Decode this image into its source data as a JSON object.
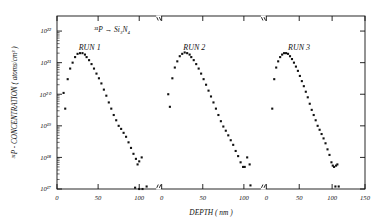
{
  "figure": {
    "annotation_implant": "³¹P → Si₃N₄",
    "xlabel": "DEPTH   ( nm )",
    "ylabel": "³¹P - CONCENTRATION  ( atoms/cm³ )"
  },
  "chart_data": {
    "type": "scatter",
    "title": "³¹P → Si₃N₄",
    "xlabel": "DEPTH (nm)",
    "ylabel": "³¹P - CONCENTRATION (atoms/cm³)",
    "yscale": "log",
    "ylim": [
      1e+17,
      3e+22
    ],
    "ytick_labels": [
      "10²²",
      "10²¹",
      "10²⁰",
      "10¹⁹",
      "10¹⁸",
      "10¹⁷"
    ],
    "ytick_values": [
      1e+22,
      1e+21,
      1e+20,
      1e+19,
      1e+18,
      1e+17
    ],
    "grid": false,
    "legend": "none",
    "axis_breaks": 2,
    "panels": [
      {
        "label": "RUN 1",
        "xlim": [
          0,
          120
        ],
        "xtick_values": [
          0,
          50,
          100
        ],
        "xtick_labels": [
          "0",
          "50",
          "100"
        ],
        "points": [
          [
            8,
            1.1e+20
          ],
          [
            10,
            3.5e+19
          ],
          [
            13,
            3e+20
          ],
          [
            16,
            6.5e+20
          ],
          [
            19,
            1e+21
          ],
          [
            22,
            1.5e+21
          ],
          [
            25,
            1.9e+21
          ],
          [
            28,
            2e+21
          ],
          [
            31,
            2e+21
          ],
          [
            34,
            1.8e+21
          ],
          [
            36,
            1.5e+21
          ],
          [
            39,
            1.2e+21
          ],
          [
            42,
            9e+20
          ],
          [
            45,
            6.5e+20
          ],
          [
            48,
            4.5e+20
          ],
          [
            51,
            3.2e+20
          ],
          [
            54,
            2.2e+20
          ],
          [
            57,
            1.4e+20
          ],
          [
            60,
            9e+19
          ],
          [
            63,
            5.5e+19
          ],
          [
            66,
            3.5e+19
          ],
          [
            69,
            2.2e+19
          ],
          [
            72,
            1.5e+19
          ],
          [
            75,
            1e+19
          ],
          [
            78,
            8e+18
          ],
          [
            81,
            6e+18
          ],
          [
            84,
            4.5e+18
          ],
          [
            87,
            3e+18
          ],
          [
            90,
            2e+18
          ],
          [
            93,
            1.3e+18
          ],
          [
            96,
            9e+17
          ],
          [
            98,
            6e+17
          ],
          [
            100,
            7.5e+17
          ],
          [
            103,
            1e+18
          ],
          [
            95,
            1.1e+17
          ],
          [
            100,
            1e+17
          ],
          [
            104,
            1e+17
          ],
          [
            109,
            1.2e+17
          ]
        ]
      },
      {
        "label": "RUN 2",
        "xlim": [
          0,
          120
        ],
        "xtick_values": [
          0,
          50,
          100
        ],
        "xtick_labels": [
          "0",
          "50",
          "100"
        ],
        "points": [
          [
            8,
            1e+20
          ],
          [
            10,
            4e+19
          ],
          [
            13,
            3.2e+20
          ],
          [
            16,
            7e+20
          ],
          [
            19,
            1.1e+21
          ],
          [
            22,
            1.6e+21
          ],
          [
            25,
            1.9e+21
          ],
          [
            28,
            2.1e+21
          ],
          [
            31,
            2e+21
          ],
          [
            34,
            1.8e+21
          ],
          [
            36,
            1.5e+21
          ],
          [
            39,
            1.2e+21
          ],
          [
            42,
            9e+20
          ],
          [
            45,
            6.5e+20
          ],
          [
            48,
            4.5e+20
          ],
          [
            51,
            3e+20
          ],
          [
            54,
            2e+20
          ],
          [
            57,
            1.3e+20
          ],
          [
            60,
            8.5e+19
          ],
          [
            63,
            5.5e+19
          ],
          [
            66,
            3.5e+19
          ],
          [
            69,
            2.2e+19
          ],
          [
            72,
            1.4e+19
          ],
          [
            75,
            9.5e+18
          ],
          [
            78,
            7e+18
          ],
          [
            81,
            5e+18
          ],
          [
            84,
            3.5e+18
          ],
          [
            87,
            2.5e+18
          ],
          [
            90,
            1.6e+18
          ],
          [
            93,
            1.1e+18
          ],
          [
            96,
            7e+17
          ],
          [
            99,
            5e+17
          ],
          [
            101,
            5e+17
          ],
          [
            104,
            1e+18
          ],
          [
            107,
            6e+17
          ],
          [
            108,
            1.3e+17
          ]
        ]
      },
      {
        "label": "RUN 3",
        "xlim": [
          0,
          150
        ],
        "xtick_values": [
          0,
          50,
          100,
          150
        ],
        "xtick_labels": [
          "0",
          "50",
          "100",
          "150"
        ],
        "points": [
          [
            9,
            3.5e+19
          ],
          [
            12,
            3e+20
          ],
          [
            15,
            7e+20
          ],
          [
            18,
            1.1e+21
          ],
          [
            21,
            1.5e+21
          ],
          [
            24,
            1.8e+21
          ],
          [
            27,
            2e+21
          ],
          [
            30,
            2e+21
          ],
          [
            33,
            1.9e+21
          ],
          [
            36,
            1.6e+21
          ],
          [
            39,
            1.3e+21
          ],
          [
            42,
            1e+21
          ],
          [
            45,
            7.5e+20
          ],
          [
            48,
            5.5e+20
          ],
          [
            51,
            3.8e+20
          ],
          [
            54,
            2.6e+20
          ],
          [
            57,
            1.8e+20
          ],
          [
            60,
            1.2e+20
          ],
          [
            63,
            8e+19
          ],
          [
            66,
            5e+19
          ],
          [
            69,
            3.2e+19
          ],
          [
            72,
            2.2e+19
          ],
          [
            75,
            1.5e+19
          ],
          [
            78,
            1e+19
          ],
          [
            81,
            7.5e+18
          ],
          [
            84,
            5.5e+18
          ],
          [
            87,
            4e+18
          ],
          [
            90,
            2.8e+18
          ],
          [
            93,
            1.8e+18
          ],
          [
            96,
            1.2e+18
          ],
          [
            99,
            7e+17
          ],
          [
            101,
            5.5e+17
          ],
          [
            103,
            5e+17
          ],
          [
            106,
            5.5e+17
          ],
          [
            108,
            6e+17
          ],
          [
            105,
            1.2e+17
          ],
          [
            110,
            1.2e+17
          ]
        ]
      }
    ]
  }
}
